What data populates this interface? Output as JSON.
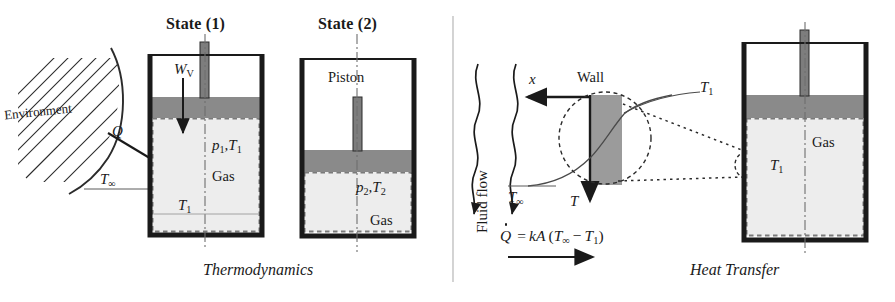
{
  "figure": {
    "width": 895,
    "height": 302,
    "background": "#ffffff"
  },
  "colors": {
    "ink": "#1a1a1a",
    "piston_gray": "#8a8a8a",
    "wall_gray": "#9b9b9b",
    "gas_fill": "#ededed",
    "divider_gray": "#c9c9c9",
    "rod_gray": "#7d7d7d"
  },
  "panels": {
    "left": {
      "caption": "Thermodynamics",
      "state1": {
        "heading": "State (1)",
        "work_label": "W",
        "work_sub": "V",
        "heat_label": "Q",
        "ambient_label": "T",
        "ambient_sub": "∞",
        "pressure_temp_label": "p",
        "pressure_temp_sub1": "1",
        "pressure_temp_mid": ",T",
        "pressure_temp_sub2": "1",
        "gas_label": "Gas",
        "inner_temp_label": "T",
        "inner_temp_sub": "1",
        "environment_label": "Environment"
      },
      "state2": {
        "heading": "State (2)",
        "piston_label": "Piston",
        "pressure_temp_label": "p",
        "pressure_temp_sub1": "2",
        "pressure_temp_mid": ",T",
        "pressure_temp_sub2": "2",
        "gas_label": "Gas"
      }
    },
    "right": {
      "caption": "Heat Transfer",
      "fluid_flow_label": "Fluid flow",
      "wall_label": "Wall",
      "x_axis_label": "x",
      "t_axis_label": "T",
      "ambient_label": "T",
      "ambient_sub": "∞",
      "surface_temp_label": "T",
      "surface_temp_sub": "1",
      "detail_temp_label": "T",
      "detail_temp_sub": "1",
      "gas_label": "Gas",
      "equation": {
        "qdot": "Q",
        "equals": "=",
        "conductance": "kA",
        "open_paren": "(",
        "ambient": "T",
        "ambient_sub": "∞",
        "minus": "−",
        "surface": "T",
        "surface_sub": "1",
        "close_paren": ")",
        "full_text": "Q̇ = kA (T∞ − T1)"
      }
    }
  }
}
